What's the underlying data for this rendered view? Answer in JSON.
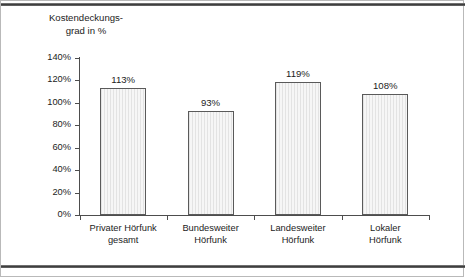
{
  "figure": {
    "title_line1": "Kostendeckungs-",
    "title_line2": "grad in %",
    "frame_color": "#b9b9b9",
    "rule_color": "#3a3a3a"
  },
  "chart_data": {
    "type": "bar",
    "xlabel": "",
    "ylabel": "Kostendeckungsgrad in %",
    "categories": [
      "Privater Hörfunk gesamt",
      "Bundesweiter Hörfunk",
      "Landesweiter Hörfunk",
      "Lokaler Hörfunk"
    ],
    "category_lines": [
      [
        "Privater Hörfunk",
        "gesamt"
      ],
      [
        "Bundesweiter",
        "Hörfunk"
      ],
      [
        "Landesweiter",
        "Hörfunk"
      ],
      [
        "Lokaler",
        "Hörfunk"
      ]
    ],
    "values": [
      113,
      93,
      119,
      108
    ],
    "value_labels": [
      "113%",
      "93%",
      "119%",
      "108%"
    ],
    "ylim": [
      0,
      140
    ],
    "ytick_values": [
      0,
      20,
      40,
      60,
      80,
      100,
      120,
      140
    ],
    "ytick_labels": [
      "0%",
      "20%",
      "40%",
      "60%",
      "80%",
      "100%",
      "120%",
      "140%"
    ],
    "grid": false,
    "legend": null,
    "bar_fill": "#f0f0f0",
    "bar_edge": "#5a5a5a"
  }
}
